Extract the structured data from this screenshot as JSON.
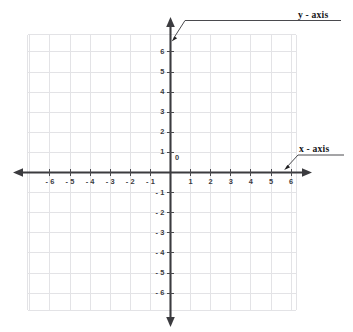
{
  "figure": {
    "title": "",
    "type": "cartesian-coordinate-plane"
  },
  "chart_data": {
    "type": "scatter",
    "title": "",
    "xlabel": "x - axis",
    "ylabel": "y - axis",
    "xlim": [
      -7,
      6.3
    ],
    "ylim": [
      -7,
      6.8
    ],
    "grid": true,
    "grid_step": 1,
    "legend": "none",
    "series": [],
    "x": [],
    "values": [],
    "origin_label": "0",
    "x_tick_values": [
      -6,
      -5,
      -4,
      -3,
      -2,
      -1,
      1,
      2,
      3,
      4,
      5,
      6
    ],
    "y_tick_values": [
      -6,
      -5,
      -4,
      -3,
      -2,
      -1,
      1,
      2,
      3,
      4,
      5,
      6
    ],
    "x_tick_labels": [
      "- 6",
      "- 5",
      "- 4",
      "- 3",
      "- 2",
      "- 1",
      "1",
      "2",
      "3",
      "4",
      "5",
      "6"
    ],
    "y_tick_labels": [
      "- 6",
      "- 5",
      "- 4",
      "- 3",
      "- 2",
      "- 1",
      "1",
      "2",
      "3",
      "4",
      "5",
      "6"
    ]
  },
  "axes": {
    "x_label": "x - axis",
    "y_label": "y - axis",
    "origin": "0"
  },
  "colors": {
    "grid": "#e3e3e6",
    "axis": "#3b3b3f",
    "text": "#16161a",
    "tick_text": "#3a3a3e",
    "background": "#ffffff"
  }
}
